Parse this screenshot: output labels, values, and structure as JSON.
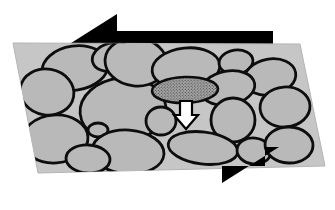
{
  "figure": {
    "description": "A sheared slab of packed rounded grains viewed in oblique projection, with opposing shear arrows above and below the slab and one highlighted stippled grain displaced downward into a pore.",
    "width": 335,
    "height": 210
  },
  "colors": {
    "background": "#ffffff",
    "slab_fill": "#c6c6c6",
    "slab_edge": "#b4b4b4",
    "grain_fill": "#b9b9b9",
    "grain_outline": "#0d0d0d",
    "shear_arrow": "#000000",
    "highlight_grain_fill": "#9d9d9d",
    "highlight_grain_stipple": "#2a2a2a",
    "motion_arrow_fill": "#ffffff",
    "motion_arrow_outline": "#000000"
  },
  "slab": {
    "name": "shear-plane-slab",
    "shape": "parallelogram",
    "points": "13,43 300,44 325,166 38,173"
  },
  "shear_arrows": [
    {
      "name": "top-shear-arrow",
      "direction": "left",
      "label": "upper block motion",
      "points": "60,50 117,14 117,31 273,31 273,50"
    },
    {
      "name": "bottom-shear-arrow",
      "direction": "right",
      "label": "lower block motion",
      "points": "75,166 265,166 265,147 279,147 279,147 222,183 222,166 75,166"
    }
  ],
  "highlight_grain": {
    "name": "highlighted-grain",
    "label": "displaced grain",
    "cx": 185,
    "cy": 90,
    "rx": 33,
    "ry": 13,
    "rotation": -2,
    "fill_pattern": "stipple"
  },
  "motion_arrow": {
    "name": "grain-motion-arrow",
    "direction": "down",
    "label": "grain displacement direction",
    "points": "180,101 192,101 192,115 198,115 186,129 174,115 180,115"
  },
  "grains": [
    {
      "name": "grain-1",
      "cx": 75,
      "cy": 68,
      "rx": 33,
      "ry": 22,
      "rot": -8
    },
    {
      "name": "grain-2",
      "cx": 112,
      "cy": 57,
      "rx": 20,
      "ry": 14,
      "rot": -14
    },
    {
      "name": "grain-3",
      "cx": 47,
      "cy": 92,
      "rx": 27,
      "ry": 23,
      "rot": 10
    },
    {
      "name": "grain-4",
      "cx": 55,
      "cy": 139,
      "rx": 33,
      "ry": 24,
      "rot": -4
    },
    {
      "name": "grain-5",
      "cx": 123,
      "cy": 110,
      "rx": 43,
      "ry": 32,
      "rot": -5
    },
    {
      "name": "grain-6",
      "cx": 136,
      "cy": 62,
      "rx": 31,
      "ry": 24,
      "rot": 6
    },
    {
      "name": "grain-7",
      "cx": 98,
      "cy": 130,
      "rx": 10,
      "ry": 7,
      "rot": 0
    },
    {
      "name": "grain-8",
      "cx": 128,
      "cy": 152,
      "rx": 36,
      "ry": 22,
      "rot": 4
    },
    {
      "name": "grain-9",
      "cx": 186,
      "cy": 68,
      "rx": 34,
      "ry": 20,
      "rot": -6
    },
    {
      "name": "grain-10",
      "cx": 236,
      "cy": 62,
      "rx": 17,
      "ry": 12,
      "rot": -8
    },
    {
      "name": "grain-11",
      "cx": 270,
      "cy": 77,
      "rx": 26,
      "ry": 18,
      "rot": -10
    },
    {
      "name": "grain-12",
      "cx": 228,
      "cy": 88,
      "rx": 27,
      "ry": 17,
      "rot": -10
    },
    {
      "name": "grain-13",
      "cx": 285,
      "cy": 107,
      "rx": 25,
      "ry": 20,
      "rot": -4
    },
    {
      "name": "grain-14",
      "cx": 233,
      "cy": 120,
      "rx": 22,
      "ry": 22,
      "rot": 0
    },
    {
      "name": "grain-15",
      "cx": 203,
      "cy": 148,
      "rx": 35,
      "ry": 16,
      "rot": 7
    },
    {
      "name": "grain-16",
      "cx": 254,
      "cy": 151,
      "rx": 17,
      "ry": 13,
      "rot": 6
    },
    {
      "name": "grain-17",
      "cx": 289,
      "cy": 145,
      "rx": 24,
      "ry": 18,
      "rot": 2
    },
    {
      "name": "grain-18",
      "cx": 161,
      "cy": 121,
      "rx": 15,
      "ry": 14,
      "rot": 0
    },
    {
      "name": "grain-19",
      "cx": 88,
      "cy": 159,
      "rx": 22,
      "ry": 14,
      "rot": 3
    }
  ]
}
